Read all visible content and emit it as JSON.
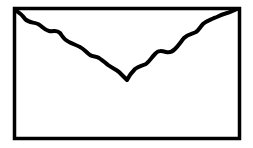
{
  "icon": {
    "name": "envelope-icon",
    "stroke_color": "#000000",
    "fill_color": "#ffffff",
    "background": "#ffffff"
  }
}
